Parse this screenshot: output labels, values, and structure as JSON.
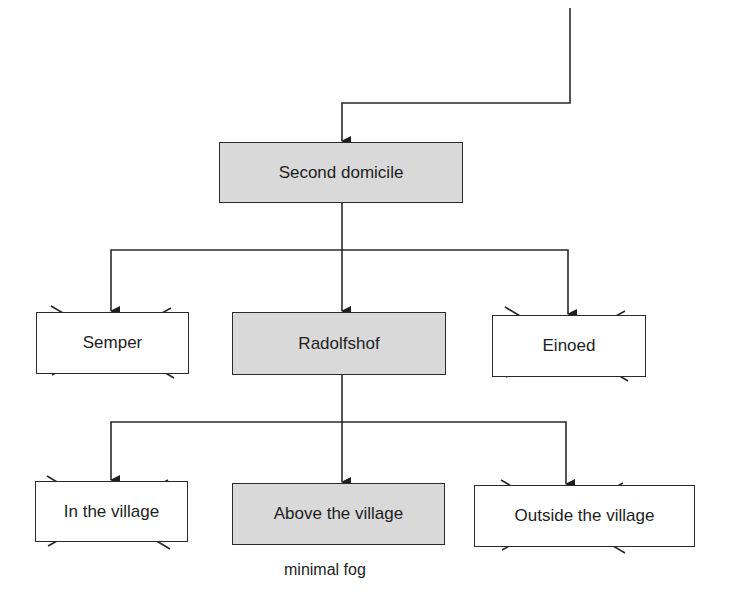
{
  "diagram": {
    "colors": {
      "selected_fill": "#d9d9d9",
      "rejected_fill": "#ffffff",
      "stroke": "#2a2a2a"
    },
    "root": {
      "label": "Second domicile",
      "status": "selected"
    },
    "level1": [
      {
        "label": "Semper",
        "status": "rejected"
      },
      {
        "label": "Radolfshof",
        "status": "selected"
      },
      {
        "label": "Einoed",
        "status": "rejected"
      }
    ],
    "level2": [
      {
        "label": "In the village",
        "status": "rejected"
      },
      {
        "label": "Above the village",
        "status": "selected",
        "note": "minimal fog"
      },
      {
        "label": "Outside the village",
        "status": "rejected"
      }
    ]
  }
}
